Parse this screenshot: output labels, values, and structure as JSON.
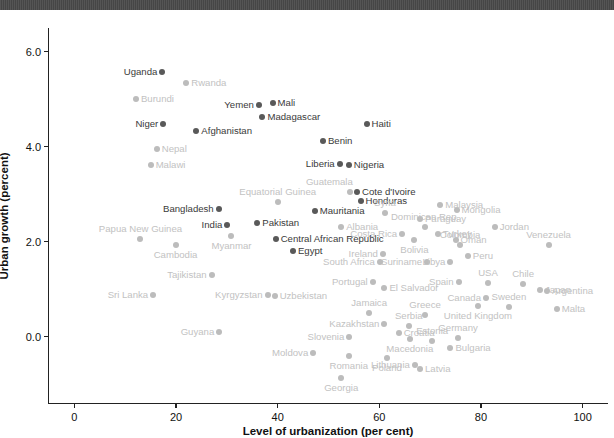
{
  "window": {
    "topbar_present": true,
    "topbar_color": "#4d4d4d"
  },
  "colors": {
    "dark_point": "#595959",
    "light_point": "#bcbcbc",
    "dark_label": "#3a3a3a",
    "light_label": "#c2c2c2",
    "axis": "#222222"
  },
  "chart_data": {
    "type": "scatter",
    "title": "",
    "xlabel": "Level of urbanization (per cent)",
    "ylabel": "Urban growth (percent)",
    "xlim": [
      -5,
      105
    ],
    "ylim": [
      -1.4,
      6.5
    ],
    "xticks": [
      0,
      20,
      40,
      60,
      80,
      100
    ],
    "xtick_labels": [
      "0",
      "20",
      "40",
      "60",
      "80",
      "100"
    ],
    "yticks": [
      0.0,
      2.0,
      4.0,
      6.0
    ],
    "ytick_labels": [
      "0.0",
      "2.0",
      "4.0",
      "6.0"
    ],
    "grid": false,
    "legend": null,
    "points": [
      {
        "name": "Uganda",
        "x": 17.3,
        "y": 5.58,
        "emph": true,
        "side": "left"
      },
      {
        "name": "Rwanda",
        "x": 22.0,
        "y": 5.35,
        "emph": false,
        "side": "right"
      },
      {
        "name": "Burundi",
        "x": 12.1,
        "y": 5.01,
        "emph": false,
        "side": "right"
      },
      {
        "name": "Yemen",
        "x": 36.3,
        "y": 4.87,
        "emph": true,
        "side": "left"
      },
      {
        "name": "Mali",
        "x": 39.0,
        "y": 4.91,
        "emph": true,
        "side": "right"
      },
      {
        "name": "Madagascar",
        "x": 37.0,
        "y": 4.63,
        "emph": true,
        "side": "right"
      },
      {
        "name": "Niger",
        "x": 17.5,
        "y": 4.47,
        "emph": true,
        "side": "left"
      },
      {
        "name": "Afghanistan",
        "x": 24.0,
        "y": 4.33,
        "emph": true,
        "side": "right"
      },
      {
        "name": "Haiti",
        "x": 57.5,
        "y": 4.47,
        "emph": true,
        "side": "right"
      },
      {
        "name": "Benin",
        "x": 48.9,
        "y": 4.11,
        "emph": true,
        "side": "right"
      },
      {
        "name": "Nepal",
        "x": 16.2,
        "y": 3.96,
        "emph": false,
        "side": "right"
      },
      {
        "name": "Liberia",
        "x": 52.2,
        "y": 3.64,
        "emph": true,
        "side": "left"
      },
      {
        "name": "Nigeria",
        "x": 54.0,
        "y": 3.62,
        "emph": true,
        "side": "right"
      },
      {
        "name": "Malawi",
        "x": 15.0,
        "y": 3.61,
        "emph": false,
        "side": "right"
      },
      {
        "name": "Guatemala",
        "x": 54.2,
        "y": 3.04,
        "emph": false,
        "side": "left-above"
      },
      {
        "name": "Cote d'Ivoire",
        "x": 55.6,
        "y": 3.04,
        "emph": true,
        "side": "right"
      },
      {
        "name": "Honduras",
        "x": 56.3,
        "y": 2.85,
        "emph": true,
        "side": "right"
      },
      {
        "name": "Equatorial Guinea",
        "x": 40.0,
        "y": 2.83,
        "emph": false,
        "side": "above"
      },
      {
        "name": "Mauritania",
        "x": 47.3,
        "y": 2.64,
        "emph": true,
        "side": "right"
      },
      {
        "name": "Syria",
        "x": 61.1,
        "y": 2.6,
        "emph": false,
        "side": "above"
      },
      {
        "name": "Bangladesh",
        "x": 28.4,
        "y": 2.68,
        "emph": true,
        "side": "left"
      },
      {
        "name": "Mongolia",
        "x": 75.2,
        "y": 2.66,
        "emph": false,
        "side": "right"
      },
      {
        "name": "Malaysia",
        "x": 72.0,
        "y": 2.78,
        "emph": false,
        "side": "right"
      },
      {
        "name": "Paraguay",
        "x": 68.0,
        "y": 2.48,
        "emph": false,
        "side": "right"
      },
      {
        "name": "Pakistan",
        "x": 36.0,
        "y": 2.4,
        "emph": true,
        "side": "right"
      },
      {
        "name": "India",
        "x": 30.1,
        "y": 2.36,
        "emph": true,
        "side": "left"
      },
      {
        "name": "Albania",
        "x": 52.5,
        "y": 2.3,
        "emph": false,
        "side": "right"
      },
      {
        "name": "Dominican Rep.",
        "x": 69.0,
        "y": 2.3,
        "emph": false,
        "side": "above"
      },
      {
        "name": "Jordan",
        "x": 82.7,
        "y": 2.31,
        "emph": false,
        "side": "right"
      },
      {
        "name": "Costa Rica",
        "x": 64.5,
        "y": 2.15,
        "emph": false,
        "side": "left"
      },
      {
        "name": "Turkey",
        "x": 71.5,
        "y": 2.16,
        "emph": false,
        "side": "right"
      },
      {
        "name": "Oman",
        "x": 75.0,
        "y": 2.03,
        "emph": false,
        "side": "right"
      },
      {
        "name": "Myanmar",
        "x": 30.9,
        "y": 2.12,
        "emph": false,
        "side": "below"
      },
      {
        "name": "Central African Republic",
        "x": 39.6,
        "y": 2.05,
        "emph": true,
        "side": "right"
      },
      {
        "name": "Bolivia",
        "x": 66.9,
        "y": 2.03,
        "emph": false,
        "side": "below"
      },
      {
        "name": "Papua New Guinea",
        "x": 13.0,
        "y": 2.06,
        "emph": false,
        "side": "above"
      },
      {
        "name": "Cambodia",
        "x": 19.9,
        "y": 1.92,
        "emph": false,
        "side": "below"
      },
      {
        "name": "Colombia",
        "x": 75.9,
        "y": 1.92,
        "emph": false,
        "side": "above"
      },
      {
        "name": "Egypt",
        "x": 43.0,
        "y": 1.8,
        "emph": true,
        "side": "right"
      },
      {
        "name": "Venezuela",
        "x": 93.3,
        "y": 1.93,
        "emph": false,
        "side": "above"
      },
      {
        "name": "Ireland",
        "x": 60.7,
        "y": 1.74,
        "emph": false,
        "side": "left"
      },
      {
        "name": "Peru",
        "x": 77.4,
        "y": 1.7,
        "emph": false,
        "side": "right"
      },
      {
        "name": "Suriname",
        "x": 69.4,
        "y": 1.58,
        "emph": false,
        "side": "left"
      },
      {
        "name": "South Africa",
        "x": 60.1,
        "y": 1.57,
        "emph": false,
        "side": "left"
      },
      {
        "name": "Libya",
        "x": 74.0,
        "y": 1.57,
        "emph": false,
        "side": "left"
      },
      {
        "name": "Spain",
        "x": 75.6,
        "y": 1.15,
        "emph": false,
        "side": "left"
      },
      {
        "name": "USA",
        "x": 81.4,
        "y": 1.12,
        "emph": false,
        "side": "above"
      },
      {
        "name": "Chile",
        "x": 88.3,
        "y": 1.1,
        "emph": false,
        "side": "above"
      },
      {
        "name": "Japan",
        "x": 91.6,
        "y": 0.98,
        "emph": false,
        "side": "right"
      },
      {
        "name": "Argentina",
        "x": 93.0,
        "y": 0.95,
        "emph": false,
        "side": "right"
      },
      {
        "name": "Portugal",
        "x": 58.7,
        "y": 1.14,
        "emph": false,
        "side": "left"
      },
      {
        "name": "El Salvador",
        "x": 61.0,
        "y": 1.02,
        "emph": false,
        "side": "right"
      },
      {
        "name": "Canada",
        "x": 81.0,
        "y": 0.82,
        "emph": false,
        "side": "left"
      },
      {
        "name": "Tajikistan",
        "x": 27.0,
        "y": 1.3,
        "emph": false,
        "side": "left"
      },
      {
        "name": "Sri Lanka",
        "x": 15.5,
        "y": 0.88,
        "emph": false,
        "side": "left"
      },
      {
        "name": "Kyrgyzstan",
        "x": 38.0,
        "y": 0.88,
        "emph": false,
        "side": "left"
      },
      {
        "name": "Uzbekistan",
        "x": 39.4,
        "y": 0.86,
        "emph": false,
        "side": "right"
      },
      {
        "name": "Sweden",
        "x": 85.5,
        "y": 0.62,
        "emph": false,
        "side": "above"
      },
      {
        "name": "Malta",
        "x": 94.9,
        "y": 0.59,
        "emph": false,
        "side": "right"
      },
      {
        "name": "United Kingdom",
        "x": 79.4,
        "y": 0.64,
        "emph": false,
        "side": "below"
      },
      {
        "name": "Jamaica",
        "x": 58.0,
        "y": 0.5,
        "emph": false,
        "side": "above"
      },
      {
        "name": "Greece",
        "x": 69.0,
        "y": 0.46,
        "emph": false,
        "side": "above"
      },
      {
        "name": "Kazakhstan",
        "x": 61.0,
        "y": 0.26,
        "emph": false,
        "side": "left"
      },
      {
        "name": "Serbia",
        "x": 65.8,
        "y": 0.23,
        "emph": false,
        "side": "above"
      },
      {
        "name": "Croatia",
        "x": 63.8,
        "y": 0.07,
        "emph": false,
        "side": "right"
      },
      {
        "name": "Slovenia",
        "x": 54.1,
        "y": 0.0,
        "emph": false,
        "side": "left"
      },
      {
        "name": "Macedonia",
        "x": 66.0,
        "y": -0.06,
        "emph": false,
        "side": "below"
      },
      {
        "name": "Estonia",
        "x": 70.4,
        "y": -0.1,
        "emph": false,
        "side": "above"
      },
      {
        "name": "Germany",
        "x": 75.5,
        "y": -0.04,
        "emph": false,
        "side": "above"
      },
      {
        "name": "Bulgaria",
        "x": 74.0,
        "y": -0.25,
        "emph": false,
        "side": "right"
      },
      {
        "name": "Guyana",
        "x": 28.5,
        "y": 0.1,
        "emph": false,
        "side": "left"
      },
      {
        "name": "Moldova",
        "x": 47.0,
        "y": -0.34,
        "emph": false,
        "side": "left"
      },
      {
        "name": "Romania",
        "x": 54.0,
        "y": -0.4,
        "emph": false,
        "side": "below"
      },
      {
        "name": "Poland",
        "x": 61.5,
        "y": -0.45,
        "emph": false,
        "side": "below"
      },
      {
        "name": "Lithuania",
        "x": 67.0,
        "y": -0.6,
        "emph": false,
        "side": "left"
      },
      {
        "name": "Latvia",
        "x": 68.0,
        "y": -0.68,
        "emph": false,
        "side": "right"
      },
      {
        "name": "Georgia",
        "x": 52.5,
        "y": -0.88,
        "emph": false,
        "side": "below"
      }
    ]
  }
}
